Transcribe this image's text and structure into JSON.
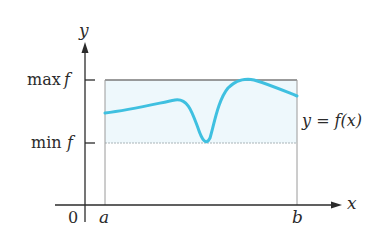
{
  "figure": {
    "type": "diagram",
    "labels": {
      "y_axis": "y",
      "x_axis": "x",
      "origin": "0",
      "a": "a",
      "b": "b",
      "max_prefix": "max",
      "max_fn": "f",
      "min_prefix": "min",
      "min_fn": "f",
      "curve": "y = f(x)"
    },
    "colors": {
      "curve": "#3fc0e0",
      "fill": "#eef8fc",
      "axes": "#2b2b2b",
      "box": "#8a8a8a"
    }
  }
}
